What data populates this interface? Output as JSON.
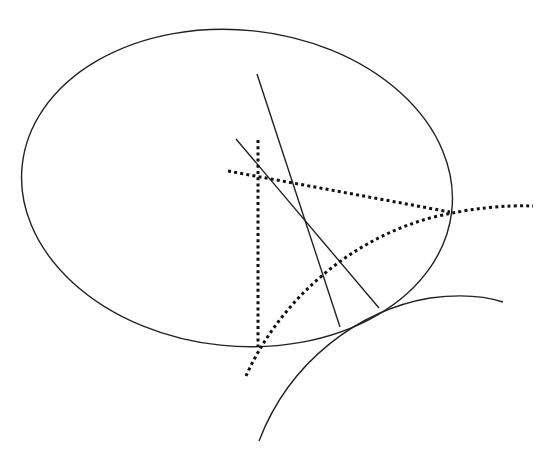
{
  "diagram": {
    "type": "geometric-construction",
    "stroke_color": "#222222",
    "background": "#ffffff",
    "ellipse": {
      "cx": 237,
      "cy": 188,
      "rx": 216,
      "ry": 158,
      "rotate": 6
    },
    "circle_arc": {
      "d": "M259,441 C290,360 360,310 430,298 C460,294 485,296 503,302"
    },
    "solid_lines": [
      {
        "x1": 257,
        "y1": 74,
        "x2": 340,
        "y2": 327
      },
      {
        "x1": 236,
        "y1": 139,
        "x2": 379,
        "y2": 308
      }
    ],
    "dotted_lines": [
      {
        "x1": 258,
        "y1": 140,
        "x2": 258,
        "y2": 347
      },
      {
        "x1": 228,
        "y1": 171,
        "x2": 450,
        "y2": 212
      }
    ],
    "dotted_arc": {
      "d": "M246,376 C280,300 350,240 430,218 C470,208 505,205 533,206"
    }
  }
}
